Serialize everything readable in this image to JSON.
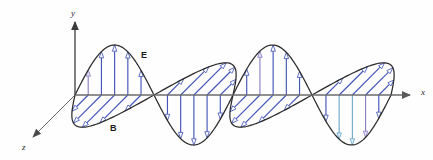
{
  "figure": {
    "background_color": "#fefefe",
    "width": 433,
    "height": 160
  },
  "axes": {
    "origin": {
      "x": 75,
      "y": 95
    },
    "x_axis": {
      "label": "x",
      "label_x": 421,
      "label_y": 95,
      "from_x": 75,
      "to_x": 410,
      "y": 95,
      "color": "#6b6b6b",
      "arrow": "right"
    },
    "y_axis": {
      "label": "y",
      "label_x": 71,
      "label_y": 16,
      "from_y": 95,
      "to_y": 22,
      "x": 75,
      "color": "#4a4a4a",
      "arrow": "up"
    },
    "z_axis": {
      "label": "z",
      "label_x": 22,
      "label_y": 150,
      "from_x": 75,
      "from_y": 95,
      "to_x": 33,
      "to_y": 137,
      "color": "#555555",
      "arrow": "down-left"
    }
  },
  "field_labels": {
    "electric": {
      "text": "E",
      "x": 141,
      "y": 58
    },
    "magnetic": {
      "text": "B",
      "x": 110,
      "y": 131
    }
  },
  "colors": {
    "wave_curve": "#2b2b2b",
    "arrow_blue": "#4356b8",
    "arrow_head_fill": "#ffffff",
    "arrow_accent_violet": "#9b8fd0",
    "arrow_accent_cyan": "#8fc3e0",
    "axis_gray": "#6b6b6b"
  },
  "chart_data": {
    "type": "line",
    "xlabel": "x",
    "ylabel": "y",
    "zlabel": "z",
    "x_start": 75,
    "x_end": 392,
    "wavelength_px": 158,
    "amplitude_px": 50,
    "series": [
      {
        "name": "E",
        "plane": "x-y",
        "arrow_direction": "vertical",
        "color": "#4356b8",
        "phase_deg": 0,
        "arrow_count": 24
      },
      {
        "name": "B",
        "plane": "x-z",
        "arrow_direction": "oblique",
        "color": "#4356b8",
        "phase_deg": 0,
        "arrow_count": 24
      }
    ],
    "grid": false,
    "legend": "inline-labels"
  }
}
